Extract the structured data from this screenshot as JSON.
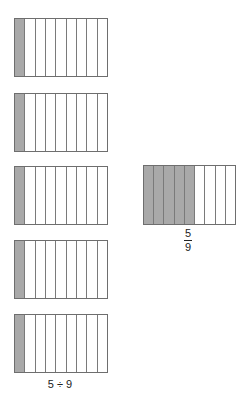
{
  "diagram": {
    "left_bars": [
      {
        "parts": 9,
        "shaded": 1
      },
      {
        "parts": 9,
        "shaded": 1
      },
      {
        "parts": 9,
        "shaded": 1
      },
      {
        "parts": 9,
        "shaded": 1
      },
      {
        "parts": 9,
        "shaded": 1
      }
    ],
    "left_label": "5 ÷ 9",
    "right_bar": {
      "parts": 9,
      "shaded": 5
    },
    "right_fraction": {
      "numerator": "5",
      "denominator": "9"
    },
    "colors": {
      "shaded": "#a9a9a9",
      "outline": "#6e6e6e",
      "background": "#ffffff"
    }
  }
}
